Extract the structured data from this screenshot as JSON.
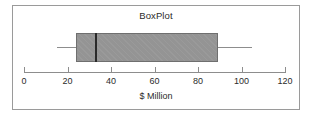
{
  "chart_data": {
    "type": "boxplot",
    "title": "BoxPlot",
    "xlabel": "$ Million",
    "ylabel": "",
    "orientation": "horizontal",
    "xlim": [
      0,
      120
    ],
    "grid": false,
    "legend": null,
    "ticks": [
      {
        "value": 0,
        "label": "0"
      },
      {
        "value": 20,
        "label": "20"
      },
      {
        "value": 40,
        "label": "40"
      },
      {
        "value": 60,
        "label": "60"
      },
      {
        "value": 80,
        "label": "80"
      },
      {
        "value": 100,
        "label": "100"
      },
      {
        "value": 120,
        "label": "120"
      }
    ],
    "boxes": [
      {
        "name": "series-1",
        "min": 15,
        "q1": 24,
        "median": 33,
        "q3": 89,
        "max": 105,
        "outliers": []
      }
    ],
    "style": {
      "box_fill": "#949494",
      "box_border": "#6f6f6f",
      "median_color": "#2a2a2a",
      "whisker_color": "#8d8d8d",
      "axis_color": "#8d8d8d",
      "frame_color": "#9a9a9a",
      "background": "#ffffff",
      "text_color": "#2b2b2b"
    }
  }
}
